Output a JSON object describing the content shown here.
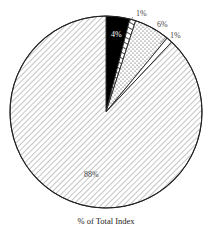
{
  "chart_data": {
    "type": "pie",
    "title": "",
    "caption": "% of Total Index",
    "start_angle_deg": 0,
    "direction": "clockwise",
    "slices": [
      {
        "label": "4%",
        "value": 4,
        "fill": "solid-black",
        "color": "#000000"
      },
      {
        "label": "1%",
        "value": 1,
        "fill": "hatch-forward",
        "color": "#ffffff"
      },
      {
        "label": "6%",
        "value": 6,
        "fill": "dotted",
        "color": "#ffffff"
      },
      {
        "label": "1%",
        "value": 1,
        "fill": "white",
        "color": "#ffffff"
      },
      {
        "label": "88%",
        "value": 88,
        "fill": "hatch-diagonal",
        "color": "#ffffff"
      }
    ],
    "legend": "none",
    "grid": false
  }
}
